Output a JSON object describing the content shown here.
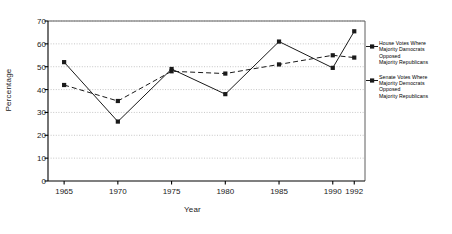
{
  "chart_data": {
    "type": "line",
    "title": "",
    "xlabel": "Year",
    "ylabel": "Percentage",
    "categories": [
      "1965",
      "1970",
      "1975",
      "1980",
      "1985",
      "1990",
      "1992"
    ],
    "x": [
      1965,
      1970,
      1975,
      1980,
      1985,
      1990,
      1992
    ],
    "xlim": [
      1963.5,
      1993
    ],
    "ylim": [
      0,
      70
    ],
    "yticks": [
      0,
      10,
      20,
      30,
      40,
      50,
      60,
      70
    ],
    "grid": true,
    "grid_axis": "y",
    "legend_position": "right",
    "series": [
      {
        "name": "House Votes Where Majority Democrats Opposed Majority Republicans",
        "values": [
          52,
          26,
          49,
          38,
          61,
          49.5,
          65.5
        ],
        "color": "#1a1a1a",
        "dash": "solid",
        "marker": "square"
      },
      {
        "name": "Senate Votes Where Majority Democrats Opposed Majority Republicans",
        "values": [
          42,
          35,
          48,
          47,
          51,
          55,
          54
        ],
        "color": "#1a1a1a",
        "dash": "dashed",
        "marker": "square"
      }
    ]
  },
  "axes": {
    "ylabel": "Percentage",
    "xlabel": "Year",
    "ytick_labels": [
      "0",
      "10",
      "20",
      "30",
      "40",
      "50",
      "60",
      "70"
    ],
    "xtick_labels": [
      "1965",
      "1970",
      "1975",
      "1980",
      "1985",
      "1990",
      "1992"
    ]
  },
  "legend": {
    "entries": [
      {
        "lines": [
          "House Votes Where",
          "Majority Damocrats",
          "Opposed",
          "Majority Republicans"
        ],
        "marker": "square-line"
      },
      {
        "lines": [
          "Senate Votes Where",
          "Majority Democrats",
          "Opposed",
          "Majority Republicans"
        ],
        "marker": "square-line"
      }
    ]
  },
  "colors": {
    "line": "#1a1a1a",
    "grid": "#b8b8b8",
    "axis": "#4d4d4d",
    "background": "#ffffff"
  }
}
